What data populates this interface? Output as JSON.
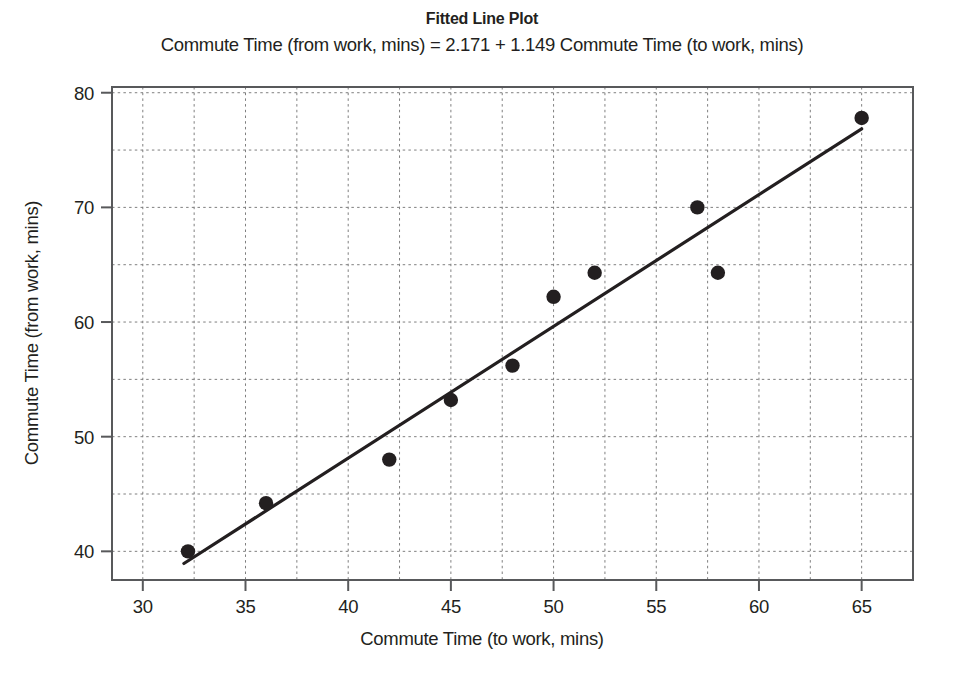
{
  "chart_data": {
    "type": "scatter",
    "title": "Fitted Line Plot",
    "subtitle": "Commute Time (from work, mins) = 2.171 + 1.149 Commute Time (to work, mins)",
    "xlabel": "Commute Time (to work, mins)",
    "ylabel": "Commute Time (from work, mins)",
    "xlim": [
      28.5,
      67.5
    ],
    "ylim": [
      37.5,
      80.5
    ],
    "x_ticks": [
      30,
      35,
      40,
      45,
      50,
      55,
      60,
      65
    ],
    "y_ticks": [
      40,
      50,
      60,
      70,
      80
    ],
    "x_minor_gridlines": [
      32.5,
      37.5,
      42.5,
      47.5,
      52.5,
      57.5,
      62.5
    ],
    "y_minor_gridlines": [
      45,
      55,
      65,
      75
    ],
    "grid": true,
    "legend": "none",
    "x": [
      32.2,
      36,
      42,
      45,
      48,
      50,
      52,
      57,
      58,
      65
    ],
    "y": [
      40.0,
      44.2,
      48.0,
      53.2,
      56.2,
      62.2,
      64.3,
      70.0,
      64.3,
      77.8
    ],
    "points": [
      {
        "x": 32.2,
        "y": 40.0
      },
      {
        "x": 36,
        "y": 44.2
      },
      {
        "x": 42,
        "y": 48.0
      },
      {
        "x": 45,
        "y": 53.2
      },
      {
        "x": 48,
        "y": 56.2
      },
      {
        "x": 50,
        "y": 62.2
      },
      {
        "x": 52,
        "y": 64.3
      },
      {
        "x": 57,
        "y": 70.0
      },
      {
        "x": 58,
        "y": 64.3
      },
      {
        "x": 65,
        "y": 77.8
      }
    ],
    "fit_line": {
      "intercept": 2.171,
      "slope": 1.149,
      "x_start": 32.0,
      "x_end": 65.0
    },
    "marker_color": "#231f20",
    "line_color": "#231f20",
    "grid_color": "#7f7f7f",
    "frame_color": "#58595b"
  }
}
